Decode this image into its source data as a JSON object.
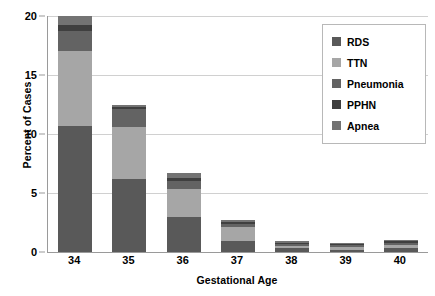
{
  "chart_data": {
    "type": "bar",
    "subtype": "stacked-bar",
    "title": "",
    "xlabel": "Gestational Age",
    "ylabel": "Percent of Cases",
    "categories": [
      "34",
      "35",
      "36",
      "37",
      "38",
      "39",
      "40"
    ],
    "ylim": [
      0,
      20
    ],
    "yticks": [
      0,
      5,
      10,
      15,
      20
    ],
    "ytick_labels": [
      "0",
      "5",
      "10",
      "15",
      "20"
    ],
    "grid": true,
    "grid_axis": "y",
    "legend_position": "upper right",
    "series": [
      {
        "name": "RDS",
        "color": "#595959",
        "values": [
          10.7,
          6.2,
          3.0,
          0.9,
          0.3,
          0.2,
          0.3
        ]
      },
      {
        "name": "TTN",
        "color": "#a6a6a6",
        "values": [
          6.3,
          4.4,
          2.3,
          1.2,
          0.2,
          0.2,
          0.3
        ]
      },
      {
        "name": "Pneumonia",
        "color": "#636363",
        "values": [
          1.7,
          1.5,
          0.7,
          0.3,
          0.2,
          0.2,
          0.2
        ]
      },
      {
        "name": "PPHN",
        "color": "#3f3f3f",
        "values": [
          0.5,
          0.2,
          0.3,
          0.15,
          0.1,
          0.1,
          0.1
        ]
      },
      {
        "name": "Apnea",
        "color": "#737373",
        "values": [
          0.8,
          0.2,
          0.4,
          0.15,
          0.1,
          0.1,
          0.1
        ]
      }
    ],
    "totals": [
      20.0,
      12.5,
      6.7,
      2.7,
      0.9,
      0.8,
      1.0
    ]
  },
  "axes": {
    "grid_color": "#d0d0d0",
    "axis_color": "#9a9a9a"
  },
  "legend": {
    "border_color": "#b8b8b8",
    "background": "#ffffff"
  }
}
